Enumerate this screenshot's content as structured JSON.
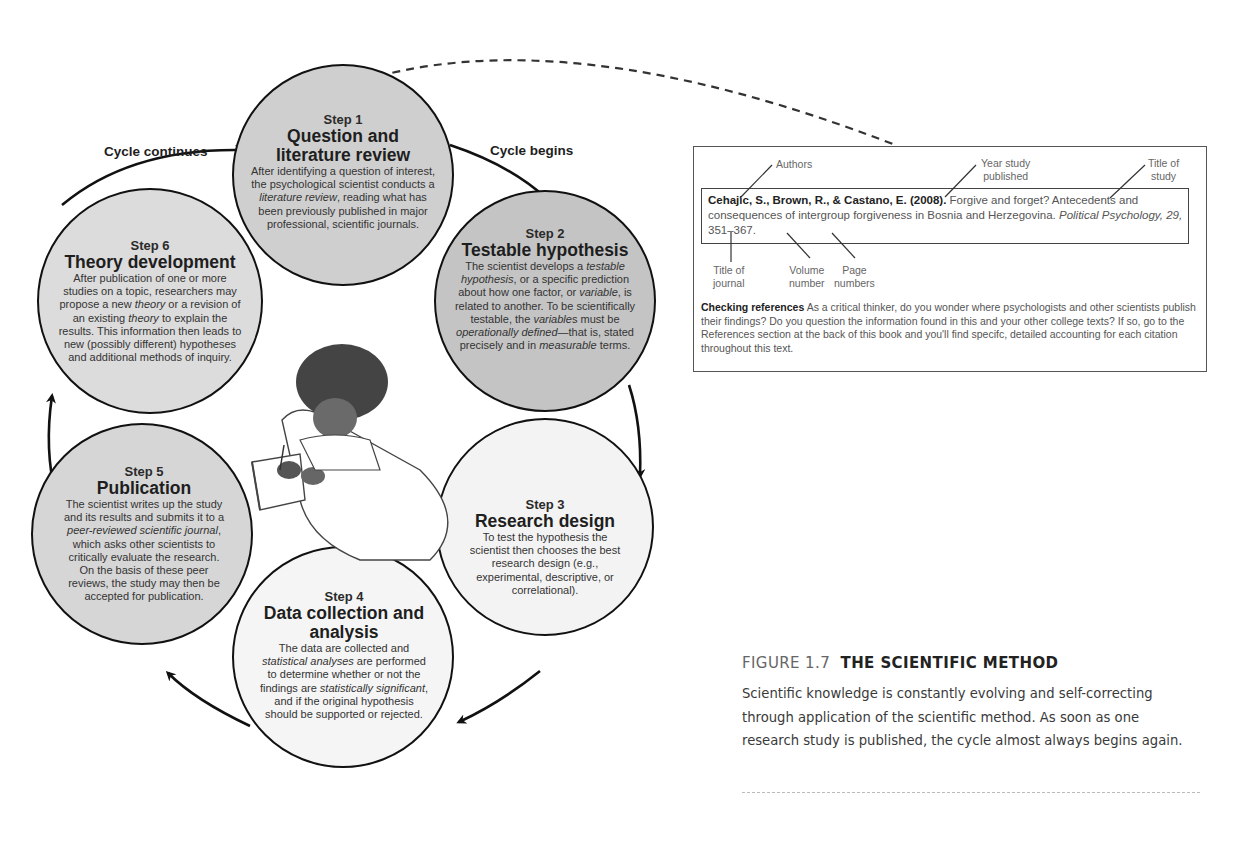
{
  "diagram": {
    "cycle_labels": {
      "continues": "Cycle continues",
      "begins": "Cycle begins"
    },
    "steps": [
      {
        "num": "Step 1",
        "title": "Question and literature review",
        "body": "After identifying a question of interest, the psychological scientist conducts a literature review, reading what has been previously published in major professional, scientific journals.",
        "italic_terms": [
          "literature review"
        ],
        "fill": "#cfcfcf"
      },
      {
        "num": "Step 2",
        "title": "Testable hypothesis",
        "body": "The scientist develops a testable hypothesis, or a specific prediction about how one factor, or variable, is related to another. To be scientifically testable, the variables must be operationally defined—that is, stated precisely and in measurable terms.",
        "italic_terms": [
          "testable hypothesis",
          "variable",
          "operationally defined",
          "measurable"
        ],
        "fill": "#c4c4c4"
      },
      {
        "num": "Step 3",
        "title": "Research design",
        "body": "To test the hypothesis the scientist then chooses the best research design (e.g., experimental, descriptive, or correlational).",
        "italic_terms": [],
        "fill": "#f3f3f3"
      },
      {
        "num": "Step 4",
        "title": "Data collection and analysis",
        "body": "The data are collected and statistical analyses are performed to determine whether or not the findings are statistically significant, and if the original hypothesis should be supported or rejected.",
        "italic_terms": [
          "statistical analyses",
          "statistically significant"
        ],
        "fill": "#f5f5f5"
      },
      {
        "num": "Step 5",
        "title": "Publication",
        "body": "The scientist writes up the study and its results and submits it to a peer-reviewed scientific journal, which asks other scientists to critically evaluate the research. On the basis of these peer reviews, the study may then be accepted for publication.",
        "italic_terms": [
          "peer-reviewed scientific journal"
        ],
        "fill": "#d6d6d6"
      },
      {
        "num": "Step 6",
        "title": "Theory development",
        "body": "After publication of one or more studies on a topic, researchers may propose a new theory or a revision of an existing theory to explain the results. This information then leads to new (possibly different) hypotheses and additional methods of inquiry.",
        "italic_terms": [
          "theory"
        ],
        "fill": "#dcdcdc"
      }
    ],
    "illustration": "scientist-writing-in-notebook"
  },
  "reference_panel": {
    "annotations": {
      "authors": "Authors",
      "year": [
        "Year study",
        "published"
      ],
      "title_of_study": [
        "Title of",
        "study"
      ],
      "title_of_journal": [
        "Title of",
        "journal"
      ],
      "volume": [
        "Volume",
        "number"
      ],
      "pages": [
        "Page",
        "numbers"
      ]
    },
    "citation": {
      "authors_year": "Cehajic, S., Brown, R., & Castano, E. (2008).",
      "title": "Forgive and forget? Antecedents and consequences of intergroup forgiveness in Bosnia and Herzegovina.",
      "journal": "Political Psychology,",
      "volume": "29,",
      "pages": "351–367."
    },
    "checking": {
      "heading": "Checking references",
      "text": "As a critical thinker, do you wonder where psychologists and other scientists publish their findings? Do you question the information found in this and your other college texts? If so, go to the References section at the back of this book and you'll find specifc, detailed accounting for each citation throughout this text."
    }
  },
  "figure": {
    "number": "FIGURE 1.7",
    "name": "THE SCIENTIFIC METHOD",
    "caption": "Scientific knowledge is constantly evolving and self-correcting through application of the scientific method. As soon as one research study is published, the cycle almost always begins again."
  }
}
